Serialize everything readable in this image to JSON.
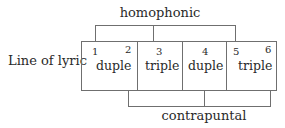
{
  "diagram": {
    "row_label": "Line of lyric",
    "top_bracket": {
      "label": "homophonic"
    },
    "bottom_bracket": {
      "label": "contrapuntal"
    },
    "segments": [
      {
        "numbers": [
          "1",
          "2"
        ],
        "meter": "duple"
      },
      {
        "numbers": [
          "3"
        ],
        "meter": "triple"
      },
      {
        "numbers": [
          "4"
        ],
        "meter": "duple"
      },
      {
        "numbers": [
          "5",
          "6"
        ],
        "meter": "triple"
      }
    ],
    "line_color": "#6f6f6f",
    "text_color": "#2a2a2a"
  }
}
